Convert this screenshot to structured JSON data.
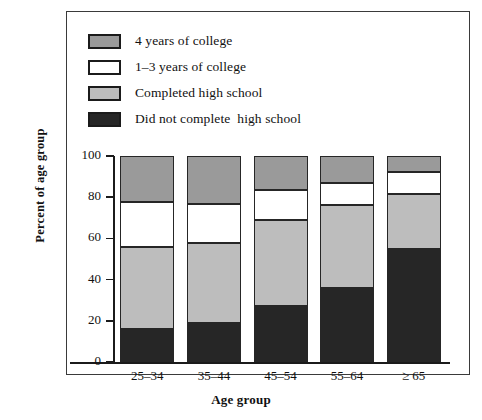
{
  "chart_data": {
    "type": "bar",
    "subtype": "stacked-bar-100-percent",
    "title": "",
    "xlabel": "Age group",
    "ylabel": "Percent of age group",
    "categories": [
      "25–34",
      "35–44",
      "45–54",
      "55–64",
      "≥ 65"
    ],
    "ylim": [
      0,
      100
    ],
    "yticks": [
      0,
      20,
      40,
      60,
      80,
      100
    ],
    "ytick_labels": [
      "0",
      "20",
      "40",
      "60",
      "80",
      "100"
    ],
    "grid": false,
    "legend_position": "top-left-inside",
    "stack_order_bottom_to_top": [
      "Did not complete  high school",
      "Completed high school",
      "1–3 years of college",
      "4 years of college"
    ],
    "series": [
      {
        "name": "Did not complete  high school",
        "color": "#262626",
        "values": [
          16,
          19,
          27,
          36,
          55
        ]
      },
      {
        "name": "Completed high school",
        "color": "#bdbdbd",
        "values": [
          40,
          39,
          42,
          40,
          26.5
        ]
      },
      {
        "name": "1–3 years of college",
        "color": "#ffffff",
        "values": [
          21.5,
          18.5,
          14.5,
          11,
          10.5
        ]
      },
      {
        "name": "4 years of college",
        "color": "#9a9a9a",
        "values": [
          22.5,
          23.5,
          16.5,
          13,
          8
        ]
      }
    ],
    "cumulative_tops": [
      [
        16,
        56,
        77.5,
        100
      ],
      [
        19,
        58,
        76.5,
        100
      ],
      [
        27,
        69,
        83.5,
        100
      ],
      [
        36,
        76,
        87,
        100
      ],
      [
        55,
        81.5,
        92,
        100
      ]
    ]
  },
  "legend": {
    "items": [
      {
        "label": "4 years of college",
        "color": "#9a9a9a"
      },
      {
        "label": "1–3 years of college",
        "color": "#ffffff"
      },
      {
        "label": "Completed high school",
        "color": "#bdbdbd"
      },
      {
        "label": "Did not complete  high school",
        "color": "#262626"
      }
    ]
  },
  "colors": {
    "four_year_college": "#9a9a9a",
    "some_college": "#ffffff",
    "completed_high_school": "#bdbdbd",
    "no_high_school": "#262626",
    "outline": "#262626",
    "axis": "#1b1b1b",
    "background": "#ffffff"
  }
}
